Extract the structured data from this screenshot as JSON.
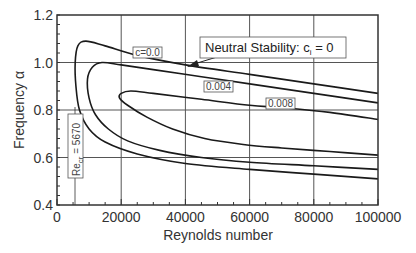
{
  "chart_data": {
    "type": "line",
    "title": "",
    "xlabel": "Reynolds number",
    "ylabel": "Frequency α",
    "xlim": [
      0,
      100000
    ],
    "ylim": [
      0.4,
      1.2
    ],
    "xticks": [
      "0",
      "20000",
      "40000",
      "60000",
      "80000",
      "100000"
    ],
    "yticks": [
      "0.4",
      "0.6",
      "0.8",
      "1.0",
      "1.2"
    ],
    "grid": true,
    "series": [
      {
        "name": "c_i = 0.0 (neutral stability)",
        "label": "c=0.0",
        "points": [
          [
            100000,
            0.87
          ],
          [
            80000,
            0.91
          ],
          [
            60000,
            0.95
          ],
          [
            40000,
            0.99
          ],
          [
            25000,
            1.03
          ],
          [
            15000,
            1.07
          ],
          [
            9000,
            1.09
          ],
          [
            6500,
            1.07
          ],
          [
            5670,
            1.0
          ],
          [
            5900,
            0.9
          ],
          [
            7000,
            0.8
          ],
          [
            10000,
            0.72
          ],
          [
            15000,
            0.665
          ],
          [
            25000,
            0.615
          ],
          [
            40000,
            0.575
          ],
          [
            60000,
            0.55
          ],
          [
            80000,
            0.53
          ],
          [
            100000,
            0.51
          ]
        ]
      },
      {
        "name": "c_i = 0.004",
        "label": "0.004",
        "points": [
          [
            100000,
            0.83
          ],
          [
            80000,
            0.87
          ],
          [
            60000,
            0.91
          ],
          [
            45000,
            0.94
          ],
          [
            30000,
            0.97
          ],
          [
            20000,
            0.99
          ],
          [
            14000,
            1.0
          ],
          [
            11000,
            0.98
          ],
          [
            9500,
            0.93
          ],
          [
            10000,
            0.85
          ],
          [
            12000,
            0.78
          ],
          [
            16000,
            0.72
          ],
          [
            22000,
            0.67
          ],
          [
            32000,
            0.63
          ],
          [
            45000,
            0.6
          ],
          [
            60000,
            0.58
          ],
          [
            80000,
            0.565
          ],
          [
            100000,
            0.55
          ]
        ]
      },
      {
        "name": "c_i = 0.008",
        "label": "0.008",
        "points": [
          [
            100000,
            0.76
          ],
          [
            85000,
            0.79
          ],
          [
            70000,
            0.81
          ],
          [
            60000,
            0.82
          ],
          [
            45000,
            0.845
          ],
          [
            30000,
            0.87
          ],
          [
            23000,
            0.88
          ],
          [
            20000,
            0.87
          ],
          [
            19500,
            0.85
          ],
          [
            22000,
            0.82
          ],
          [
            28000,
            0.77
          ],
          [
            36000,
            0.72
          ],
          [
            46000,
            0.68
          ],
          [
            58000,
            0.655
          ],
          [
            70000,
            0.64
          ],
          [
            85000,
            0.625
          ],
          [
            100000,
            0.61
          ]
        ]
      }
    ],
    "annotations": [
      {
        "text": "Neutral Stability: c_i = 0",
        "main": "Neutral Stability: c",
        "sub": "i",
        "tail": " = 0",
        "arrow_to": [
          37000,
          0.995
        ]
      },
      {
        "text": "Re_cr = 5670",
        "main": "Re",
        "sub": "cr",
        "tail": " = 5670",
        "orientation": "vertical",
        "x": 5670
      }
    ]
  }
}
